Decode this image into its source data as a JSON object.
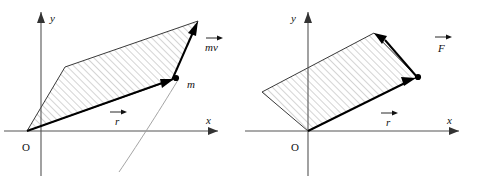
{
  "figure": {
    "type": "physics-vector-diagram",
    "background_color": "#ffffff",
    "panels": [
      {
        "id": "left",
        "name": "angular-momentum-panel",
        "origin_label": "O",
        "axes": {
          "x_label": "x",
          "y_label": "y",
          "color": "#555555"
        },
        "vectors": [
          {
            "name": "position-vector",
            "label": "r",
            "overset_arrow": true,
            "label_x": 115,
            "label_y": 124,
            "from": [
              27,
              131
            ],
            "to": [
              172,
              80
            ],
            "color": "#000000"
          },
          {
            "name": "momentum-vector",
            "label": "mv",
            "overset_arrow": true,
            "label_x": 206,
            "label_y": 50,
            "from": [
              172,
              80
            ],
            "to": [
              198,
              21
            ],
            "color": "#000000"
          }
        ],
        "point_mass": {
          "name": "particle",
          "label": "m",
          "label_x": 187,
          "label_y": 87,
          "cx": 176,
          "cy": 78,
          "radius": 3.1,
          "color": "#000000"
        },
        "parallelogram": {
          "name": "cross-product-area",
          "points": "27,131 65,67 198,21 172,80",
          "hatch": true,
          "hatch_color": "#8c8c8c",
          "edge_color": "#3a3a3a"
        },
        "trajectory": {
          "name": "particle-path",
          "color": "#9a9a9a",
          "path": "M 119,172 C 134,150 158,113 178,80"
        }
      },
      {
        "id": "right",
        "name": "torque-panel",
        "origin_label": "O",
        "axes": {
          "x_label": "x",
          "y_label": "y",
          "color": "#555555"
        },
        "vectors": [
          {
            "name": "position-vector",
            "label": "r",
            "overset_arrow": true,
            "label_x": 145,
            "label_y": 126,
            "from": [
              67,
              131
            ],
            "to": [
              171,
              79
            ],
            "color": "#000000"
          },
          {
            "name": "force-vector",
            "label": "F",
            "overset_arrow": true,
            "label_x": 199,
            "label_y": 50,
            "from": [
              171,
              79
            ],
            "to": [
              138,
              33
            ],
            "color": "#000000"
          }
        ],
        "point_mass": {
          "name": "application-point",
          "label": "",
          "label_x": 0,
          "label_y": 0,
          "cx": 176,
          "cy": 77,
          "radius": 3.1,
          "color": "#000000"
        },
        "parallelogram": {
          "name": "cross-product-area",
          "points": "67,131 21,92 133,33 176,77",
          "hatch": true,
          "hatch_color": "#8c8c8c",
          "edge_color": "#3a3a3a"
        },
        "trajectory": null
      }
    ]
  }
}
